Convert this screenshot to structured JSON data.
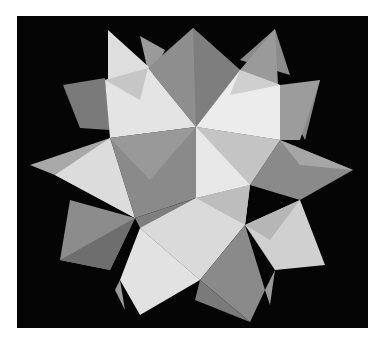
{
  "photo": {
    "subject": "modular origami stellated polyhedron",
    "colors": {
      "background": "#050505",
      "border": "#ffffff",
      "light": "#e6e6e6",
      "mid": "#b4b4b4",
      "dark": "#828282",
      "darker": "#6a6a6a"
    }
  }
}
